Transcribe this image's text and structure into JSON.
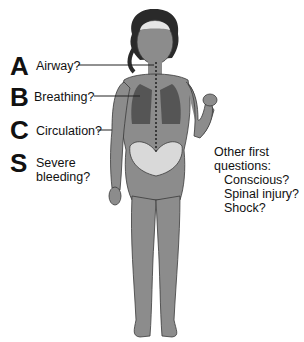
{
  "diagram": {
    "checks": [
      {
        "letter": "A",
        "label": "Airway?"
      },
      {
        "letter": "B",
        "label": "Breathing?"
      },
      {
        "letter": "C",
        "label": "Circulation?"
      },
      {
        "letter": "S",
        "label_line1": "Severe",
        "label_line2": "bleeding?"
      }
    ],
    "other": {
      "heading": "Other first questions:",
      "items": [
        "Conscious?",
        "Spinal injury?",
        "Shock?"
      ]
    },
    "colors": {
      "body": "#8c8c8c",
      "outline": "#3a3a3a",
      "lungs": "#555555",
      "pelvis": "#d9d9d9",
      "hair": "#2a2a2a",
      "brain": "#e6e6e6"
    }
  }
}
